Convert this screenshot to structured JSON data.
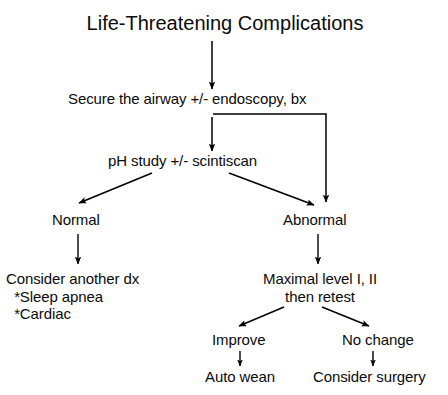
{
  "figure": {
    "title": "Life-Threatening Complications",
    "type": "clinical-algorithm-flowchart",
    "background_color": "#ffffff",
    "line_color": "#000000",
    "text_color": "#000000"
  },
  "nodes": {
    "title": "Life-Threatening Complications",
    "secure_airway": "Secure the airway +/- endoscopy, bx",
    "ph_study": "pH study +/- scintiscan",
    "normal": "Normal",
    "abnormal": "Abnormal",
    "consider_another_dx": "Consider another dx\n  *Sleep apnea\n  *Cardiac",
    "consider_another_dx_line1": "Consider another dx",
    "consider_another_dx_line2": "*Sleep apnea",
    "consider_another_dx_line3": "*Cardiac",
    "maximal_level": "Maximal level I, II\nthen retest",
    "maximal_level_line1": "Maximal level I, II",
    "maximal_level_line2": "then retest",
    "improve": "Improve",
    "no_change": "No change",
    "auto_wean": "Auto wean",
    "consider_surgery": "Consider surgery"
  },
  "edges": [
    {
      "from": "title",
      "to": "secure_airway",
      "style": "vertical-arrow"
    },
    {
      "from": "secure_airway",
      "to": "ph_study",
      "style": "vertical-arrow"
    },
    {
      "from": "secure_airway",
      "to": "abnormal",
      "style": "elbow-arrow"
    },
    {
      "from": "ph_study",
      "to": "normal",
      "style": "diagonal-arrow-left"
    },
    {
      "from": "ph_study",
      "to": "abnormal",
      "style": "diagonal-arrow-right"
    },
    {
      "from": "normal",
      "to": "consider_another_dx",
      "style": "vertical-arrow"
    },
    {
      "from": "abnormal",
      "to": "maximal_level",
      "style": "vertical-arrow"
    },
    {
      "from": "maximal_level",
      "to": "improve",
      "style": "diagonal-arrow-left"
    },
    {
      "from": "maximal_level",
      "to": "no_change",
      "style": "diagonal-arrow-right"
    },
    {
      "from": "improve",
      "to": "auto_wean",
      "style": "vertical-arrow"
    },
    {
      "from": "no_change",
      "to": "consider_surgery",
      "style": "vertical-arrow"
    }
  ]
}
